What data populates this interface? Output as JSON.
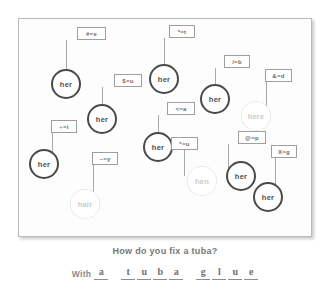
{
  "worksheet": {
    "nodes": [
      {
        "word": "her",
        "style": "bold",
        "code": "#=e",
        "cx": 32,
        "cy": 50,
        "d": 30,
        "box_x": 58,
        "box_y": 8,
        "box_w": 29,
        "box_h": 13,
        "stem_x": 47,
        "stem_y": 21,
        "stem_h": 29
      },
      {
        "word": "her",
        "style": "bold",
        "code": "*=t",
        "cx": 130,
        "cy": 45,
        "d": 30,
        "box_x": 150,
        "box_y": 6,
        "box_w": 26,
        "box_h": 13,
        "stem_x": 145,
        "stem_y": 19,
        "stem_h": 26
      },
      {
        "word": "her",
        "style": "bold",
        "code": "$=u",
        "cx": 68,
        "cy": 85,
        "d": 30,
        "box_x": 95,
        "box_y": 55,
        "box_w": 28,
        "box_h": 13,
        "stem_x": 83,
        "stem_y": 68,
        "stem_h": 26
      },
      {
        "word": "her",
        "style": "bold",
        "code": "/=b",
        "cx": 181,
        "cy": 65,
        "d": 30,
        "box_x": 205,
        "box_y": 36,
        "box_w": 26,
        "box_h": 13,
        "stem_x": 196,
        "stem_y": 49,
        "stem_h": 26
      },
      {
        "word": "here",
        "style": "faded",
        "code": "&=d",
        "cx": 222,
        "cy": 82,
        "d": 30,
        "box_x": 246,
        "box_y": 50,
        "box_w": 27,
        "box_h": 13,
        "stem_x": 247,
        "stem_y": 63,
        "stem_h": 27
      },
      {
        "word": "her",
        "style": "bold",
        "code": "<=a",
        "cx": 124,
        "cy": 113,
        "d": 30,
        "box_x": 148,
        "box_y": 83,
        "box_w": 28,
        "box_h": 13,
        "stem_x": 139,
        "stem_y": 96,
        "stem_h": 26
      },
      {
        "word": "her",
        "style": "bold",
        "code": "÷=i",
        "cx": 10,
        "cy": 130,
        "d": 30,
        "box_x": 32,
        "box_y": 101,
        "box_w": 26,
        "box_h": 13,
        "stem_x": 33,
        "stem_y": 114,
        "stem_h": 27
      },
      {
        "word": "her",
        "style": "bold",
        "code": "@=p",
        "cx": 207,
        "cy": 142,
        "d": 30,
        "box_x": 219,
        "box_y": 112,
        "box_w": 28,
        "box_h": 13,
        "stem_x": 209,
        "stem_y": 125,
        "stem_h": 26
      },
      {
        "word": "hen",
        "style": "faded",
        "code": "*=u",
        "cx": 168,
        "cy": 147,
        "d": 30,
        "box_x": 152,
        "box_y": 118,
        "box_w": 27,
        "box_h": 13,
        "stem_x": 165,
        "stem_y": 131,
        "stem_h": 26
      },
      {
        "word": "her",
        "style": "bold",
        "code": "X=g",
        "cx": 234,
        "cy": 163,
        "d": 30,
        "box_x": 252,
        "box_y": 126,
        "box_w": 26,
        "box_h": 13,
        "stem_x": 256,
        "stem_y": 139,
        "stem_h": 30
      },
      {
        "word": "hair",
        "style": "faded",
        "code": "~=y",
        "cx": 51,
        "cy": 170,
        "d": 30,
        "box_x": 73,
        "box_y": 133,
        "box_w": 26,
        "box_h": 13,
        "stem_x": 74,
        "stem_y": 146,
        "stem_h": 32
      }
    ]
  },
  "riddle": {
    "question": "How do you fix a tuba?",
    "with_label": "With",
    "answer_words": [
      {
        "letters": [
          "a"
        ]
      },
      {
        "letters": [
          "t",
          "u",
          "b",
          "a"
        ]
      },
      {
        "letters": [
          "g",
          "l",
          "u",
          "e"
        ]
      }
    ]
  }
}
